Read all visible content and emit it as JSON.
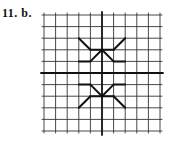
{
  "problem": {
    "number": "11.",
    "part": "b.",
    "label": "11.  b."
  },
  "grid": {
    "columns_left": 5,
    "columns_right": 5,
    "rows_above": 5,
    "rows_below": 5,
    "origin_px": [
      102,
      73
    ],
    "cell_px": 11.6,
    "line_color": "#333333",
    "axis_color": "#111111",
    "shape_color": "#111111"
  },
  "figure": {
    "top_shape_segments": [
      [
        [
          -2,
          3
        ],
        [
          -1,
          2
        ]
      ],
      [
        [
          -1,
          2
        ],
        [
          1,
          2
        ]
      ],
      [
        [
          1,
          2
        ],
        [
          2,
          3
        ]
      ],
      [
        [
          -2,
          1
        ],
        [
          -1,
          1
        ]
      ],
      [
        [
          -1,
          1
        ],
        [
          0,
          2
        ]
      ],
      [
        [
          0,
          2
        ],
        [
          1,
          1
        ]
      ],
      [
        [
          1,
          1
        ],
        [
          2,
          1
        ]
      ]
    ],
    "bottom_shape_segments": [
      [
        [
          -2,
          -1
        ],
        [
          -1,
          -1
        ]
      ],
      [
        [
          -1,
          -1
        ],
        [
          0,
          -2
        ]
      ],
      [
        [
          0,
          -2
        ],
        [
          1,
          -1
        ]
      ],
      [
        [
          1,
          -1
        ],
        [
          2,
          -1
        ]
      ],
      [
        [
          -2,
          -3
        ],
        [
          -1,
          -2
        ]
      ],
      [
        [
          -1,
          -2
        ],
        [
          1,
          -2
        ]
      ],
      [
        [
          1,
          -2
        ],
        [
          2,
          -3
        ]
      ]
    ]
  }
}
